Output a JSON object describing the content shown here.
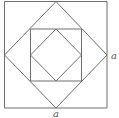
{
  "diagram": {
    "stroke_color": "#6e6e6e",
    "labels": {
      "side_right": "a",
      "side_bottom": "a"
    },
    "shapes": [
      {
        "name": "outer-square",
        "points": [
          [
            4.5,
            1.5
          ],
          [
            107,
            1.5
          ],
          [
            107,
            108
          ],
          [
            4.5,
            108
          ]
        ]
      },
      {
        "name": "outer-diamond",
        "points": [
          [
            56,
            1.5
          ],
          [
            107,
            55
          ],
          [
            56,
            108
          ],
          [
            4.5,
            55
          ]
        ]
      },
      {
        "name": "inner-square",
        "points": [
          [
            30.5,
            29
          ],
          [
            81.5,
            29
          ],
          [
            81.5,
            81
          ],
          [
            30.5,
            81
          ]
        ]
      },
      {
        "name": "inner-diamond",
        "points": [
          [
            56,
            29
          ],
          [
            81.5,
            55
          ],
          [
            56,
            81
          ],
          [
            30.5,
            55
          ]
        ]
      }
    ]
  }
}
